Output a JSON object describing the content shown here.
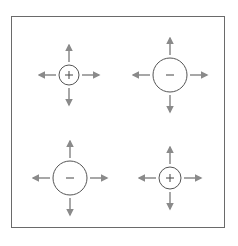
{
  "diagram": {
    "colors": {
      "frame": "#6a6a6a",
      "circle": "#555555",
      "arrow": "#8a8a8a",
      "sign": "#555555"
    },
    "items": [
      {
        "id": "top-left",
        "sign": "+",
        "cx": 69,
        "cy": 75,
        "r": 10,
        "arrow_gap": 3,
        "arrow_len": 17
      },
      {
        "id": "top-right",
        "sign": "–",
        "cx": 170,
        "cy": 75,
        "r": 17,
        "arrow_gap": 3,
        "arrow_len": 17
      },
      {
        "id": "bottom-left",
        "sign": "–",
        "cx": 70,
        "cy": 178,
        "r": 17,
        "arrow_gap": 3,
        "arrow_len": 17
      },
      {
        "id": "bottom-right",
        "sign": "+",
        "cx": 170,
        "cy": 178,
        "r": 11,
        "arrow_gap": 3,
        "arrow_len": 17
      }
    ]
  }
}
